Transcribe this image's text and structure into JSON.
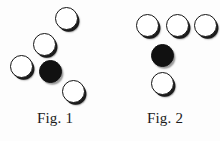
{
  "page": {
    "background_color": "#fdfdfd",
    "width": 220,
    "height": 141,
    "kind": "two-panel circle-arrangement diagram"
  },
  "style": {
    "open_fill": "#ffffff",
    "open_stroke": "#141414",
    "filled_fill": "#111111",
    "shadow_color": "#1b1b1b",
    "caption_color": "#1a1a1a",
    "node_diameter": 23
  },
  "figures": [
    {
      "id": "fig-1",
      "caption": "Fig. 1",
      "description": "Five discs: four open discs along a diagonal from lower-left to upper-right, one filled disc at centre, and one open disc below-right of the filled disc.",
      "nodes": [
        {
          "name": "node-top-right",
          "state": "open",
          "x": 55,
          "y": 7,
          "d": 23
        },
        {
          "name": "node-upper-middle",
          "state": "open",
          "x": 33,
          "y": 33,
          "d": 23
        },
        {
          "name": "node-left",
          "state": "open",
          "x": 10,
          "y": 55,
          "d": 23
        },
        {
          "name": "node-centre",
          "state": "filled",
          "x": 39,
          "y": 60,
          "d": 23
        },
        {
          "name": "node-lower-right",
          "state": "open",
          "x": 62,
          "y": 80,
          "d": 23
        }
      ]
    },
    {
      "id": "fig-2",
      "caption": "Fig. 2",
      "description": "Five discs: three open discs in a top row, one filled disc centred below the row, and one open disc at the bottom of the same column.",
      "nodes": [
        {
          "name": "node-top-left",
          "state": "open",
          "x": 26,
          "y": 14,
          "d": 23
        },
        {
          "name": "node-top-centre",
          "state": "open",
          "x": 56,
          "y": 14,
          "d": 23
        },
        {
          "name": "node-top-right",
          "state": "open",
          "x": 84,
          "y": 14,
          "d": 23
        },
        {
          "name": "node-middle",
          "state": "filled",
          "x": 41,
          "y": 44,
          "d": 23
        },
        {
          "name": "node-bottom",
          "state": "open",
          "x": 41,
          "y": 72,
          "d": 23
        }
      ]
    }
  ]
}
